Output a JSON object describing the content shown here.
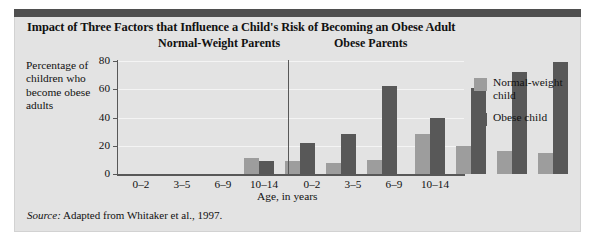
{
  "figure": {
    "title": "Impact of Three Factors that Influence a Child's Risk of Becoming an Obese Adult",
    "source_label": "Source:",
    "source_text": " Adapted from Whitaker et al., 1997.",
    "accent_bar_color": "#4f4f4f",
    "panel_background": "#e3e3e3"
  },
  "chart_data": {
    "type": "bar",
    "title": "Impact of Three Factors that Influence a Child's Risk of Becoming an Obese Adult",
    "xlabel": "Age, in years",
    "ylabel": "Percentage of children who become obese adults",
    "ylim": [
      0,
      80
    ],
    "yticks": [
      0,
      20,
      40,
      60,
      80
    ],
    "grid": true,
    "legend_position": "right",
    "categories": [
      "0–2",
      "3–5",
      "6–9",
      "10–14"
    ],
    "panels": [
      {
        "name": "Normal-Weight Parents",
        "series": [
          {
            "name": "Normal-weight child",
            "color": "#9d9d9d",
            "values": [
              11,
              9,
              8,
              10
            ]
          },
          {
            "name": "Obese child",
            "color": "#585858",
            "values": [
              9,
              22,
              28,
              62
            ]
          }
        ]
      },
      {
        "name": "Obese Parents",
        "series": [
          {
            "name": "Normal-weight child",
            "color": "#9d9d9d",
            "values": [
              28,
              20,
              16,
              15
            ]
          },
          {
            "name": "Obese child",
            "color": "#585858",
            "values": [
              40,
              61,
              72,
              79
            ]
          }
        ]
      }
    ],
    "legend": [
      {
        "label": "Normal-weight child",
        "color": "#9d9d9d"
      },
      {
        "label": "Obese child",
        "color": "#585858"
      }
    ]
  }
}
